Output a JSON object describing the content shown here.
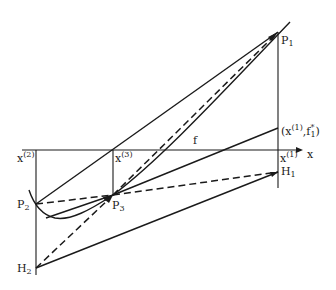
{
  "diagram": {
    "type": "geometric construction (cutting-plane / linearization iteration)",
    "axis": {
      "label": "x"
    },
    "points": {
      "P1": {
        "label": "P",
        "sub": "1"
      },
      "P2": {
        "label": "P",
        "sub": "2"
      },
      "P3": {
        "label": "P",
        "sub": "3"
      },
      "H1": {
        "label": "H",
        "sub": "1"
      },
      "H2": {
        "label": "H",
        "sub": "2"
      }
    },
    "ticks": {
      "x1": {
        "label": "x",
        "sup": "(1)"
      },
      "x2": {
        "label": "x",
        "sup": "(2)"
      },
      "x3": {
        "label": "x",
        "sup": "(3)"
      }
    },
    "annotations": {
      "curve_label": "f",
      "point_label_open": "(x",
      "point_label_sup": "(1)",
      "point_label_mid": ",f",
      "point_label_sup2": "*",
      "point_label_sub2": "1",
      "point_label_close": ")"
    }
  }
}
